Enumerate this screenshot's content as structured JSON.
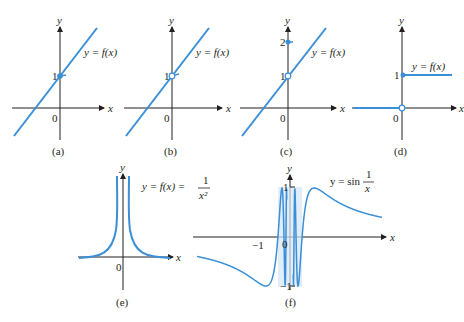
{
  "figure": {
    "panels": [
      {
        "id": "a",
        "caption": "(a)",
        "label": "y = f(x)",
        "tick": "1",
        "origin": "0",
        "xaxis": "x",
        "yaxis": "y"
      },
      {
        "id": "b",
        "caption": "(b)",
        "label": "y = f(x)",
        "tick": "1",
        "origin": "0",
        "xaxis": "x",
        "yaxis": "y"
      },
      {
        "id": "c",
        "caption": "(c)",
        "label": "y = f(x)",
        "tick1": "1",
        "tick2": "2",
        "origin": "0",
        "xaxis": "x",
        "yaxis": "y"
      },
      {
        "id": "d",
        "caption": "(d)",
        "label": "y = f(x)",
        "tick": "1",
        "origin": "0",
        "xaxis": "x",
        "yaxis": "y"
      },
      {
        "id": "e",
        "caption": "(e)",
        "label": "y = f(x) =",
        "frac_num": "1",
        "frac_den": "x²",
        "origin": "0",
        "xaxis": "x",
        "yaxis": "y"
      },
      {
        "id": "f",
        "caption": "(f)",
        "label": "y = sin",
        "frac_num": "1",
        "frac_den": "x",
        "tick_pos": "1",
        "tick_neg": "−1",
        "xtick": "−1",
        "origin": "0",
        "xaxis": "x",
        "yaxis": "y"
      }
    ]
  },
  "chart_data": [
    {
      "type": "line",
      "title": "(a)",
      "series": [
        {
          "name": "y = f(x)",
          "x": [
            -1.2,
            2.2
          ],
          "y": [
            -0.8,
            2.6
          ]
        }
      ],
      "notes": "continuous line, filled dot at (0,1)"
    },
    {
      "type": "line",
      "title": "(b)",
      "series": [
        {
          "name": "y = f(x)",
          "x": [
            -1.2,
            2.2
          ],
          "y": [
            -0.8,
            2.6
          ]
        }
      ],
      "notes": "hole (open circle) at (0,1)"
    },
    {
      "type": "line",
      "title": "(c)",
      "series": [
        {
          "name": "y = f(x)",
          "x": [
            -1.2,
            2.2
          ],
          "y": [
            -0.8,
            2.6
          ]
        }
      ],
      "notes": "open circle at (0,1), filled dot at (0,2)"
    },
    {
      "type": "line",
      "title": "(d)",
      "series": [
        {
          "name": "y = f(x)",
          "x": [
            -1,
            0,
            0,
            1
          ],
          "y": [
            0,
            0,
            1,
            1
          ]
        }
      ],
      "notes": "step function: open circle at (0,0), filled dot at (0,1)"
    },
    {
      "type": "line",
      "title": "(e)",
      "series": [
        {
          "name": "y = 1/x^2"
        }
      ],
      "notes": "vertical asymptote at x=0"
    },
    {
      "type": "line",
      "title": "(f)",
      "series": [
        {
          "name": "y = sin(1/x)"
        }
      ],
      "yticks": [
        -1,
        1
      ],
      "xticks": [
        -1,
        0
      ],
      "ylim": [
        -1,
        1
      ]
    }
  ]
}
